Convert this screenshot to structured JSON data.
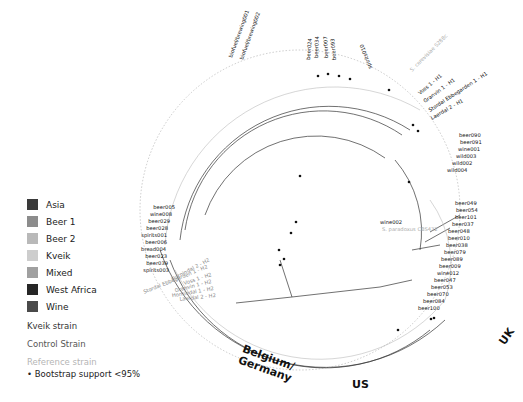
{
  "legend": {
    "populations": [
      {
        "label": "Asia",
        "color": "#3a3a3a"
      },
      {
        "label": "Beer 1",
        "color": "#8c8c8c"
      },
      {
        "label": "Beer 2",
        "color": "#b9b9b9"
      },
      {
        "label": "Kveik",
        "color": "#cdcdcd"
      },
      {
        "label": "Mixed",
        "color": "#a0a0a0"
      },
      {
        "label": "West Africa",
        "color": "#262626"
      },
      {
        "label": "Wine",
        "color": "#4a4a4a"
      }
    ],
    "strain_types": [
      {
        "label": "Kveik strain",
        "color": "#333333"
      },
      {
        "label": "Control Strain",
        "color": "#555555"
      },
      {
        "label": "Reference strain",
        "color": "#b5b5b5"
      }
    ],
    "bootstrap_note": "• Bootstrap support <95%"
  },
  "regions": {
    "uk": "UK",
    "us": "US",
    "belgium_germany_line1": "Belgium/",
    "belgium_germany_line2": "Germany"
  },
  "tree": {
    "root_labels": {
      "wine": "wine002",
      "reference": "S. paradoxus CBS432"
    },
    "leaves_right_uk": [
      "beer049",
      "beer054",
      "beer101",
      "beer037",
      "beer048",
      "beer010",
      "beer038",
      "beer079",
      "beer089",
      "beer009",
      "wine012",
      "beer047",
      "beer053",
      "beer070",
      "beer084",
      "beer100",
      "beer058",
      "beer055",
      "beer059",
      "beer001"
    ],
    "leaves_kveik_h2": [
      "Hornindal 2 - H2",
      "Stordal Ebbegarden 1 - H2",
      "Voss 1 - H2",
      "Granvin 1 - H2",
      "Hornindal 1 - H2",
      "Laerdal 2 - H2"
    ],
    "leaves_left": [
      "beer005",
      "wine008",
      "beer029",
      "beer028",
      "spirits001",
      "beer006",
      "bread004",
      "beer023",
      "beer039",
      "spirits003",
      "beer081",
      "bread001",
      "beer020",
      "bread003",
      "bread002",
      "wild006",
      "wild007",
      "wild005",
      "beer072",
      "beer063",
      "beer074"
    ],
    "leaves_top_left": [
      "spirits009",
      "beer027",
      "wine011",
      "spirits002",
      "wine015",
      "beer025",
      "wine007",
      "wine004",
      "wine009",
      "beer018",
      "beer035",
      "beer043",
      "beer031",
      "beer032",
      "beer092",
      "beer015"
    ],
    "leaves_top": [
      "biofuel/brewing001",
      "biofuel/brewing002",
      "beer026",
      "beer011",
      "beer082",
      "beer040",
      "beer097",
      "beer021",
      "beer003",
      "beer033",
      "beer087",
      "beer086",
      "beer075",
      "beer013",
      "beer012",
      "beer024",
      "beer034",
      "beer007",
      "beer093",
      "spirits010",
      "beer003",
      "beer011",
      "beer019",
      "beer004",
      "beer027",
      "beer057",
      "beer002"
    ],
    "leaves_top_right": [
      "S. cerevisiae S288c",
      "laboratory002",
      "beer016",
      "laboratory001",
      "wine003",
      "spirits005",
      "Voss 1 - H1",
      "Granvin 1 - H1",
      "Stordal Ebbegarden 1 - H1",
      "Hornindal 1 - H1",
      "Laerdal 2 - H1"
    ],
    "leaves_right_asia": [
      "sake001",
      "sake002",
      "sake003",
      "sake004",
      "sake005",
      "sake006",
      "bread005",
      "beer090",
      "beer091",
      "wine001",
      "wild003",
      "wild002",
      "wild004"
    ]
  }
}
